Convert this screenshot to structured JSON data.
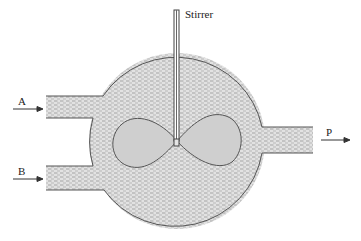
{
  "diagram": {
    "labels": {
      "stirrer": "Stirrer",
      "inlet_a": "A",
      "inlet_b": "B",
      "outlet_p": "P"
    },
    "components": [
      {
        "id": "tank",
        "shape": "circle",
        "fill": "dashed-hatch"
      },
      {
        "id": "inlet-pipe-a",
        "direction": "in",
        "side": "left"
      },
      {
        "id": "inlet-pipe-b",
        "direction": "in",
        "side": "left"
      },
      {
        "id": "outlet-pipe-p",
        "direction": "out",
        "side": "right"
      },
      {
        "id": "stirrer-shaft",
        "orientation": "vertical"
      },
      {
        "id": "impeller",
        "shape": "figure-eight",
        "lobes": 2
      }
    ],
    "colors": {
      "liquid_fill": "#d8d8d8",
      "impeller_fill": "#cfcfcf",
      "outline": "#555555",
      "hatch": "#8a8a8a"
    }
  }
}
